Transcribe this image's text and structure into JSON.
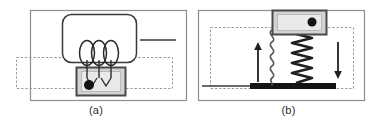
{
  "figure": {
    "background": "#ffffff",
    "width": 385,
    "height": 126
  },
  "colors": {
    "frame_stroke": "#8e8e8e",
    "dashed_stroke": "#9a9a9a",
    "dark_line": "#3a3a3a",
    "black": "#1a1a1a",
    "block_border": "#4a4a4a",
    "block_fill": "#d9d9d9",
    "block_inner_fill": "#e8e8e8",
    "spring_dark": "#2b2b2b",
    "spring_light": "#6f6f6f",
    "caption_text": "#2b2b2b"
  },
  "panels": [
    {
      "id": "a",
      "caption": "(a)",
      "elements": {
        "outer_frame": "solid-rectangle-border",
        "dashed_region": "dashed-rectangle",
        "rounded_body": "rounded-rectangle",
        "lead_line": "horizontal-line-segment",
        "coil": "three-loop-helix",
        "armature_block": "filled-block-with-dot",
        "contact_dot": "black-filled-circle"
      }
    },
    {
      "id": "b",
      "caption": "(b)",
      "elements": {
        "outer_frame": "solid-rectangle-border",
        "dashed_region": "dashed-rectangle",
        "mass_block": "filled-block-with-dot",
        "contact_dot": "black-filled-circle",
        "thin_spring": "thin-sinusoidal-spring",
        "thick_spring": "thick-coil-spring",
        "base_bar": "thick-black-base",
        "ground_line": "horizontal-line-segment",
        "arrow_up": "up-arrow",
        "arrow_down": "down-arrow"
      }
    }
  ]
}
